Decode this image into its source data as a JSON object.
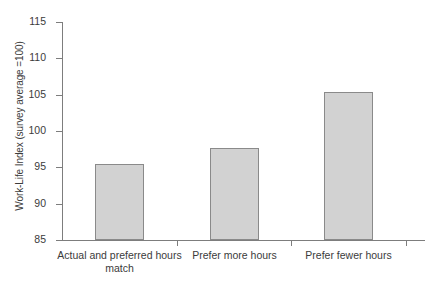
{
  "chart_data": {
    "type": "bar",
    "title": "",
    "subtitle": "",
    "xlabel": "",
    "ylabel": "Work-Life Index (survey average =100)",
    "categories": [
      "Actual and preferred hours match",
      "Prefer more hours",
      "Prefer fewer hours"
    ],
    "category_lines": [
      [
        "Actual and preferred hours",
        "match"
      ],
      [
        "Prefer more hours"
      ],
      [
        "Prefer fewer hours"
      ]
    ],
    "values": [
      95.5,
      97.7,
      105.3
    ],
    "ylim": [
      85,
      115
    ],
    "yticks": [
      85,
      90,
      95,
      100,
      105,
      110,
      115
    ],
    "ytick_labels": [
      "85",
      "90",
      "95",
      "100",
      "105",
      "110",
      "115"
    ],
    "grid": false,
    "legend": null,
    "colors": {
      "bar_fill": "#d2d2d2",
      "bar_border": "#8a8a8a",
      "axis": "#7d7d7d",
      "text": "#3b3b3b",
      "background": "#ffffff"
    }
  }
}
